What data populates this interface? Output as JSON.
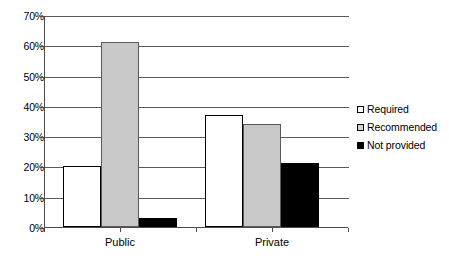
{
  "chart_data": {
    "type": "bar",
    "title": "",
    "subtitle": "",
    "xlabel": "",
    "ylabel": "",
    "categories": [
      "Public",
      "Private"
    ],
    "series": [
      {
        "name": "Required",
        "values": [
          20,
          37
        ],
        "color": "#ffffff"
      },
      {
        "name": "Recommended",
        "values": [
          61,
          34
        ],
        "color": "#c8c8c8"
      },
      {
        "name": "Not provided",
        "values": [
          3,
          21
        ],
        "color": "#000000"
      }
    ],
    "ylim": [
      0,
      70
    ],
    "ytick_values": [
      0,
      10,
      20,
      30,
      40,
      50,
      60,
      70
    ],
    "ytick_labels": [
      "0%",
      "10%",
      "20%",
      "30%",
      "40%",
      "50%",
      "60%",
      "70%"
    ],
    "grid": true,
    "legend_position": "right"
  },
  "legend": {
    "items": [
      {
        "label": "Required",
        "swatch": "required"
      },
      {
        "label": "Recommended",
        "swatch": "recommended"
      },
      {
        "label": "Not provided",
        "swatch": "notprovided"
      }
    ]
  },
  "colors": {
    "required": "#ffffff",
    "recommended": "#c8c8c8",
    "not_provided": "#000000",
    "axis": "#4d4d4d",
    "gridline": "#595959",
    "background": "#ffffff"
  }
}
